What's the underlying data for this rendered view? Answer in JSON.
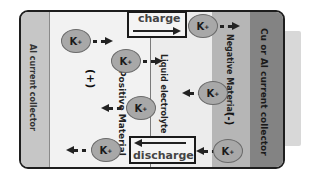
{
  "diagram": {
    "left_collector": "Al current collector",
    "right_collector": "Cu or Al current collector",
    "positive_material": "Positive Material",
    "positive_sign": "(+)",
    "electrolyte": "Liquid electrolyte",
    "negative_material": "Negative Material",
    "negative_sign": "(-)",
    "charge_label": "charge",
    "discharge_label": "discharge",
    "ion_label": "K",
    "ion_charge": "+"
  },
  "colors": {
    "al_collector": "#c6c6c6",
    "positive": "#f2f2f2",
    "electrolyte": "#ececec",
    "negative": "#b6b6b6",
    "cu_collector": "#838383",
    "ion": "#a8a8a8"
  }
}
